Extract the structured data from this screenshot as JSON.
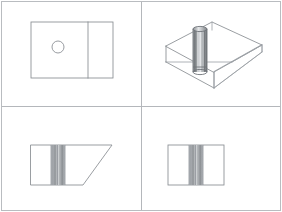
{
  "sheet": {
    "title": "Multiview orthographic drawing with isometric pictorial",
    "width": 282,
    "height": 212,
    "background_color": "#ffffff",
    "border_color": "#b9bcc0",
    "divider_color": "#b4b7bb",
    "line_color": "#888c91",
    "cylinder_outline_color": "#6f7479",
    "divider_x": 141,
    "divider_y": 106
  },
  "viewports": {
    "top_left": {
      "name": "top-view",
      "label": "Top view",
      "description": "Rectangle with a vertical partition line near the right and a small circle (through hole) on the left half",
      "rect": {
        "x": 31,
        "y": 22,
        "width": 82,
        "height": 56
      },
      "partition_line_x": 88,
      "hole": {
        "cx": 58,
        "cy": 47,
        "r": 6
      }
    },
    "top_right": {
      "name": "isometric-view",
      "label": "Isometric pictorial view",
      "description": "Wireframe block with an angled chamfer face at the right and a shaded vertical cylinder through the center",
      "cylinder": {
        "cx": 200,
        "top_y": 29,
        "bottom_y": 72,
        "half_width": 7,
        "ellipse_ry": 2.6,
        "stripe_count": 6
      }
    },
    "bottom_left": {
      "name": "side-view",
      "label": "Side view",
      "description": "Rectangle whose right side is cut by a diagonal chamfer, with hidden vertical lines of the hole near the center-left",
      "rect": {
        "x": 31,
        "y": 145,
        "width": 81,
        "height": 40
      },
      "chamfer": {
        "from_x": 112,
        "from_y": 145,
        "to_x": 83,
        "to_y": 185
      },
      "hidden_lines_x": [
        52,
        55,
        58,
        61,
        64
      ]
    },
    "bottom_right": {
      "name": "front-view",
      "label": "Front view",
      "description": "Rectangle with hidden vertical lines of the hole in the middle",
      "rect": {
        "x": 168,
        "y": 145,
        "width": 56,
        "height": 40
      },
      "hidden_lines_x": [
        190,
        193,
        196,
        199,
        202
      ]
    }
  },
  "colors": {
    "paper": "#ffffff",
    "border": "#b9bcc0",
    "geometry": "#888c91",
    "hidden": "#9ba0a5",
    "cylinder_dark": "#5d6165",
    "cylinder_light": "#e8eaec"
  }
}
